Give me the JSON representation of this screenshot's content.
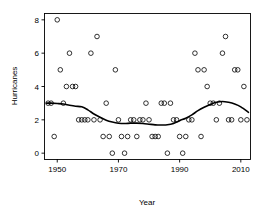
{
  "chart_data": {
    "type": "scatter",
    "title": "",
    "xlabel": "Year",
    "ylabel": "Hurricanes",
    "xlim": [
      1946,
      2013
    ],
    "ylim": [
      -0.35,
      8.35
    ],
    "grid": false,
    "legend": null,
    "xticks": [
      1950,
      1970,
      1990,
      2010
    ],
    "yticks": [
      0,
      2,
      4,
      6,
      8
    ],
    "marker": "open-circle",
    "point_color": "#000000",
    "curve_color": "#000000",
    "series": [
      {
        "name": "Hurricanes per year",
        "x": [
          1947,
          1948,
          1949,
          1950,
          1951,
          1952,
          1953,
          1954,
          1955,
          1956,
          1957,
          1958,
          1959,
          1960,
          1961,
          1962,
          1963,
          1964,
          1965,
          1966,
          1967,
          1968,
          1969,
          1970,
          1971,
          1972,
          1973,
          1974,
          1975,
          1976,
          1977,
          1978,
          1979,
          1980,
          1981,
          1982,
          1983,
          1984,
          1985,
          1986,
          1987,
          1988,
          1989,
          1990,
          1991,
          1992,
          1993,
          1994,
          1995,
          1996,
          1997,
          1998,
          1999,
          2000,
          2001,
          2002,
          2003,
          2004,
          2005,
          2006,
          2007,
          2008,
          2009,
          2010,
          2011,
          2012
        ],
        "y": [
          3,
          3,
          1,
          8,
          5,
          3,
          4,
          6,
          4,
          4,
          2,
          2,
          2,
          2,
          6,
          2,
          7,
          2,
          1,
          3,
          1,
          0,
          5,
          2,
          1,
          0,
          1,
          2,
          2,
          1,
          2,
          2,
          3,
          2,
          1,
          1,
          1,
          3,
          3,
          0,
          3,
          2,
          2,
          1,
          0,
          1,
          2,
          2,
          6,
          5,
          1,
          5,
          4,
          3,
          3,
          2,
          3,
          6,
          7,
          2,
          2,
          5,
          5,
          2,
          4,
          2
        ],
        "marker": "open-circle"
      }
    ],
    "fit_curve": {
      "name": "lowess smoother",
      "x": [
        1946.5,
        1948,
        1950,
        1952,
        1954,
        1956,
        1958,
        1960,
        1962,
        1964,
        1966,
        1968,
        1970,
        1972,
        1974,
        1976,
        1978,
        1980,
        1982,
        1984,
        1986,
        1988,
        1990,
        1992,
        1994,
        1996,
        1998,
        2000,
        2002,
        2004,
        2006,
        2008,
        2010,
        2012.5
      ],
      "y": [
        3.0,
        3.0,
        2.98,
        2.95,
        2.88,
        2.82,
        2.78,
        2.6,
        2.35,
        2.15,
        1.98,
        1.87,
        1.8,
        1.78,
        1.8,
        1.8,
        1.78,
        1.74,
        1.7,
        1.69,
        1.7,
        1.78,
        1.95,
        2.1,
        2.3,
        2.55,
        2.75,
        2.92,
        3.05,
        3.1,
        3.05,
        2.95,
        2.78,
        2.45
      ]
    }
  },
  "axes": {
    "y_tick_labels": [
      "0",
      "2",
      "4",
      "6",
      "8"
    ],
    "x_tick_labels": [
      "1950",
      "1970",
      "1990",
      "2010"
    ],
    "x_axis_title": "Year",
    "y_axis_title": "Hurricanes"
  }
}
